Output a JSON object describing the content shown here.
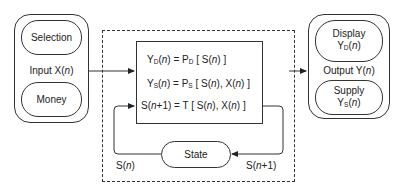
{
  "diagram": {
    "type": "state-machine block diagram",
    "input_group": {
      "label_prefix": "Input X(",
      "label_var": "n",
      "label_suffix": ")",
      "items": [
        {
          "label": "Selection"
        },
        {
          "label": "Money"
        }
      ]
    },
    "output_group": {
      "label_prefix": "Output Y(",
      "label_var": "n",
      "label_suffix": ")",
      "items": [
        {
          "label": "Display",
          "symbol": "Y",
          "sub": "D",
          "var": "n"
        },
        {
          "label": "Supply",
          "symbol": "Y",
          "sub": "S",
          "var": "n"
        }
      ]
    },
    "equations": [
      {
        "lhs": "Y",
        "lhs_sub": "D",
        "text": "Y_D(n) = P_D [ S(n) ]",
        "mid": " = P",
        "mid_sub": "D",
        "rhs": " [ S(",
        "rhs_end": ") ]"
      },
      {
        "lhs": "Y",
        "lhs_sub": "S",
        "text": "Y_S(n) = P_S [ S(n), X(n) ]",
        "mid": " = P",
        "mid_sub": "S",
        "rhs": " [ S(",
        "rhs_mid": "), X(",
        "rhs_end": ") ]"
      },
      {
        "text": "S(n+1) = T [ S(n), X(n) ]",
        "a": "S(",
        "a_var": "n",
        "a_end": "+1) = T [ S(",
        "b_end": "), X(",
        "c_end": ") ]"
      }
    ],
    "state_node": {
      "label": "State"
    },
    "feedback_labels": {
      "left": {
        "prefix": "S(",
        "var": "n",
        "suffix": ")"
      },
      "right": {
        "prefix": "S(",
        "var": "n",
        "suffix": "+1)"
      }
    },
    "var": "n",
    "open_paren": "(",
    "close_paren": ")",
    "colors": {
      "stroke": "#333333",
      "text": "#222222",
      "background": "#ffffff"
    }
  }
}
